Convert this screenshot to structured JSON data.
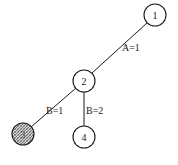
{
  "diagram": {
    "type": "tree",
    "nodes": [
      {
        "id": "1",
        "label": "1",
        "cx": 155,
        "cy": 15,
        "r": 11,
        "shaded": false
      },
      {
        "id": "2",
        "label": "2",
        "cx": 84,
        "cy": 81,
        "r": 11,
        "shaded": false
      },
      {
        "id": "3",
        "label": "3",
        "cx": 23,
        "cy": 134,
        "r": 11,
        "shaded": true
      },
      {
        "id": "4",
        "label": "4",
        "cx": 84,
        "cy": 137,
        "r": 11,
        "shaded": false
      }
    ],
    "edges": [
      {
        "from": "1",
        "to": "2",
        "label": "A=1",
        "label_x": 122,
        "label_y": 51
      },
      {
        "from": "2",
        "to": "3",
        "label": "B=1",
        "label_x": 46,
        "label_y": 114
      },
      {
        "from": "2",
        "to": "4",
        "label": "B=2",
        "label_x": 86,
        "label_y": 114
      }
    ],
    "colors": {
      "stroke": "#1a1a1a",
      "background": "#ffffff",
      "shaded_fill": "#9a9a9a"
    }
  }
}
